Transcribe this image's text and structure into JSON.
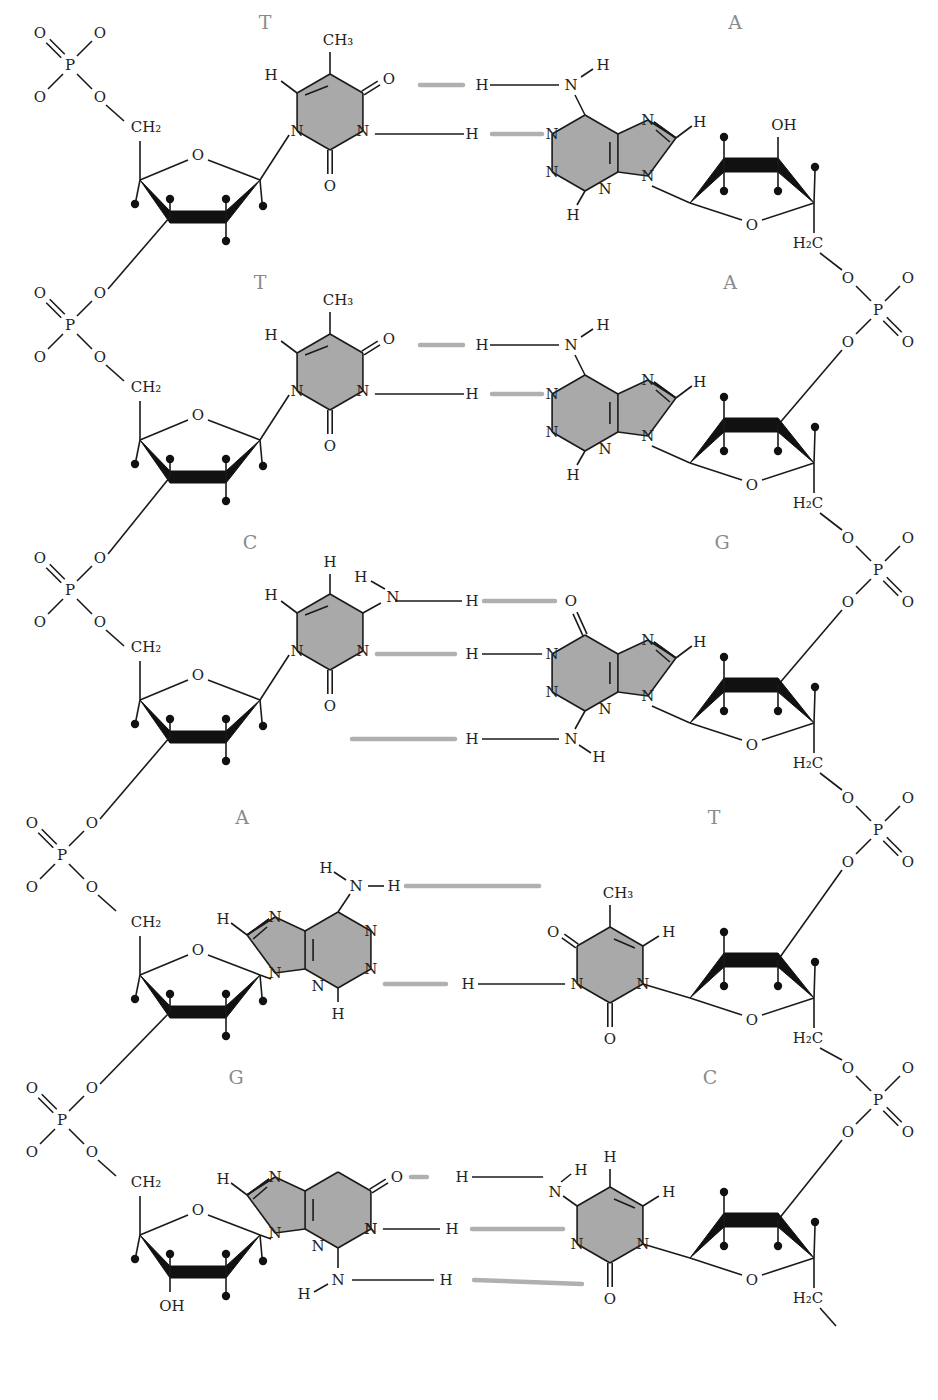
{
  "diagram": {
    "title": "",
    "colors": {
      "base_fill": "#a9a9a9",
      "hydrogen_bond": "#b0b0b0",
      "base_label": "#8a8a8a",
      "bond": "#1a1a1a"
    },
    "base_pairs": [
      {
        "left": "T",
        "right": "A",
        "hydrogen_bonds": 2
      },
      {
        "left": "T",
        "right": "A",
        "hydrogen_bonds": 2
      },
      {
        "left": "C",
        "right": "G",
        "hydrogen_bonds": 3
      },
      {
        "left": "A",
        "right": "T",
        "hydrogen_bonds": 2
      },
      {
        "left": "G",
        "right": "C",
        "hydrogen_bonds": 3
      }
    ],
    "atoms": {
      "O": "O",
      "P": "P",
      "N": "N",
      "H": "H",
      "CH2": "CH₂",
      "H2C": "H₂C",
      "CH3": "CH₃",
      "OH": "OH"
    }
  }
}
